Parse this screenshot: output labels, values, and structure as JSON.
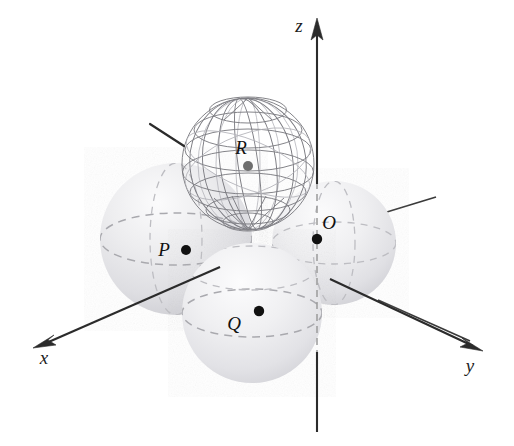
{
  "figure": {
    "background_color": "#ffffff",
    "width": 514,
    "height": 446
  },
  "axes": [
    {
      "id": "x",
      "label": "x",
      "label_x": 44,
      "label_y": 364,
      "direction": "lower-left",
      "arrow_tip_x": 36,
      "arrow_tip_y": 344,
      "color": "#2b2b2b"
    },
    {
      "id": "y",
      "label": "y",
      "label_x": 468,
      "label_y": 372,
      "direction": "lower-right",
      "arrow_tip_x": 480,
      "arrow_tip_y": 350,
      "color": "#2b2b2b"
    },
    {
      "id": "z",
      "label": "z",
      "label_x": 297,
      "label_y": 30,
      "direction": "up",
      "arrow_tip_x": 317,
      "arrow_tip_y": 20,
      "color": "#2b2b2b"
    }
  ],
  "origin": {
    "label": "O",
    "label_x": 325,
    "label_y": 229,
    "dot_x": 317,
    "dot_y": 239,
    "dot_radius": 5.2
  },
  "spheres": [
    {
      "id": "P",
      "label": "P",
      "label_x": 164,
      "label_y": 256,
      "dot_x": 186,
      "dot_y": 250,
      "dot_radius": 5.0,
      "center_x": 176,
      "center_y": 239,
      "radius": 76,
      "style": "shaded",
      "fill": "#e4e4e6",
      "description": "sphere centred on the x-axis"
    },
    {
      "id": "Q",
      "label": "Q",
      "label_x": 234,
      "label_y": 330,
      "dot_x": 259,
      "dot_y": 311,
      "dot_radius": 5.2,
      "center_x": 252,
      "center_y": 313,
      "radius": 70,
      "style": "shaded",
      "fill": "#e6e6e8",
      "description": "sphere in front, below the origin"
    },
    {
      "id": "R",
      "label": "R",
      "label_x": 241,
      "label_y": 154,
      "dot_x": 248,
      "dot_y": 166,
      "dot_radius": 5.0,
      "center_x": 248,
      "center_y": 164,
      "radius": 66,
      "style": "wireframe",
      "fill": "none",
      "description": "wireframe globe sphere on top"
    },
    {
      "id": "S",
      "label": "",
      "dot_x": null,
      "dot_y": null,
      "dot_radius": 0,
      "center_x": 334,
      "center_y": 243,
      "radius": 62,
      "style": "shaded",
      "fill": "#ebebed",
      "description": "sphere on the y-axis side, behind the origin"
    }
  ],
  "annotations": [
    {
      "id": "leader",
      "name": "pointer-line-to-sphere-R",
      "x1": 150,
      "y1": 124,
      "x2": 184,
      "y2": 146
    }
  ],
  "colors": {
    "ink": "#2b2b2b",
    "sphere_fill": "#e6e6e8",
    "sphere_shadow": "#cfcfd3",
    "wire": "#7d7d83",
    "dash": "#a9a9ae"
  }
}
